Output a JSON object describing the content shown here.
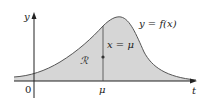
{
  "diagram": {
    "type": "area-under-curve",
    "axis_labels": {
      "y": "y",
      "x": "t"
    },
    "origin_label": "0",
    "mu_tick_label": "μ",
    "curve_label": "y = f(x)",
    "line_label": "x = μ",
    "region_label": "ℛ",
    "colors": {
      "region_fill": "#d6d6d6",
      "curve": "#555555",
      "axis": "#222222"
    }
  }
}
